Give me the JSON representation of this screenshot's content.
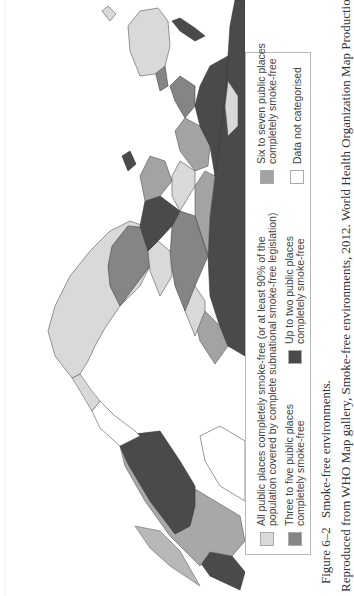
{
  "figure": {
    "number": "Figure 6–2",
    "title": "Smoke-free environments.",
    "credit": "Reproduced from WHO Map gallery, Smoke-free environments, 2012. World Health Organization Map Production:",
    "orientation": "rotated 90° counter-clockwise (north points left)"
  },
  "legend": {
    "items": [
      {
        "key": "all",
        "line1": "All public places completely smoke-free (or at least 90% of the",
        "line2": "population covered by complete subnational smoke-free legislation)",
        "color": "#d9d9d9"
      },
      {
        "key": "six_seven",
        "line1": "Six to seven public places",
        "line2": "completely smoke-free",
        "color": "#a3a3a3"
      },
      {
        "key": "three_five",
        "line1": "Three to five public places",
        "line2": "completely smoke-free",
        "color": "#858585"
      },
      {
        "key": "up_to_two",
        "line1": "Up to two public places",
        "line2": "completely smoke-free",
        "color": "#4a4a4a"
      },
      {
        "key": "no_data",
        "line1": "Data not categorised",
        "line2": "",
        "color": "#ffffff"
      }
    ]
  },
  "map": {
    "regions": [
      {
        "name": "North America (USA)",
        "category": "up_to_two"
      },
      {
        "name": "Canada",
        "category": "all"
      },
      {
        "name": "Mexico",
        "category": "up_to_two"
      },
      {
        "name": "South America (most)",
        "category": "all"
      },
      {
        "name": "Argentina/Chile south",
        "category": "three_five"
      },
      {
        "name": "Russia",
        "category": "up_to_two"
      },
      {
        "name": "China",
        "category": "up_to_two"
      },
      {
        "name": "Australia",
        "category": "all"
      },
      {
        "name": "Africa (mixed)",
        "category": "mixed"
      },
      {
        "name": "Europe (mixed)",
        "category": "mixed"
      }
    ]
  }
}
